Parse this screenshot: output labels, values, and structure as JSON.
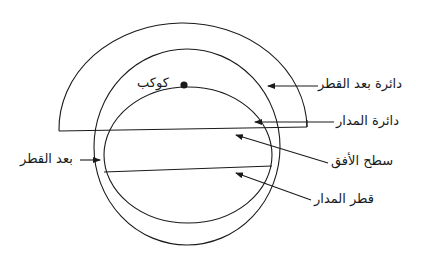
{
  "diagram": {
    "type": "astronomical-geometry",
    "background": "#ffffff",
    "stroke_color": "#1a1a1a",
    "labels": {
      "planet": "كوكب",
      "latitude_distance_circle": "دائرة بعد القطر",
      "orbit_circle": "دائرة المدار",
      "horizon_plane": "سطح الأفق",
      "polar_distance": "بعد القطر",
      "orbit_diameter": "قطر المدار"
    },
    "shapes": {
      "outer_semicircle": {
        "cx": 183,
        "cy": 129,
        "rx": 124,
        "ry": 106
      },
      "horizon_circle": {
        "cx": 187,
        "cy": 147,
        "rx": 93,
        "ry": 98
      },
      "orbit_ellipse": {
        "cx": 188,
        "cy": 155,
        "rx": 84,
        "ry": 68
      },
      "horizon_line": {
        "x1": 59,
        "y1": 131,
        "x2": 307,
        "y2": 127
      },
      "diameter_line": {
        "x1": 104,
        "y1": 172,
        "x2": 272,
        "y2": 166
      },
      "planet_dot": {
        "cx": 184,
        "cy": 85,
        "r": 3.5
      }
    }
  }
}
